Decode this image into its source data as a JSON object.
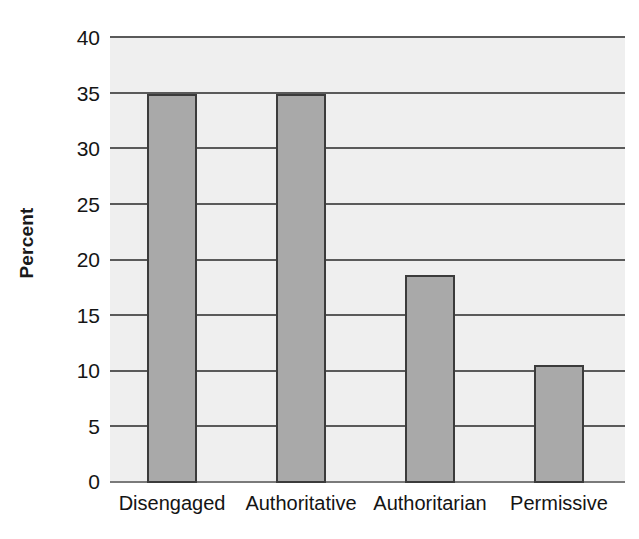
{
  "chart_data": {
    "type": "bar",
    "title": "",
    "xlabel": "",
    "ylabel": "Percent",
    "categories": [
      "Disengaged",
      "Authoritative",
      "Authoritarian",
      "Permissive"
    ],
    "values": [
      35,
      35,
      18.7,
      10.6
    ],
    "ylim": [
      0,
      40
    ],
    "ytick_labels": [
      "40",
      "35",
      "30",
      "25",
      "20",
      "15",
      "10",
      "5",
      "0"
    ],
    "ytick_values": [
      40,
      35,
      30,
      25,
      20,
      15,
      10,
      5,
      0
    ],
    "grid": true,
    "legend": "none",
    "series": [
      {
        "name": "Percent",
        "values": [
          35,
          35,
          18.7,
          10.6
        ],
        "color": "#a9a9a9",
        "edge_color": "#3b3b3b"
      }
    ],
    "plot_background": "#efefef",
    "figure_background": "#ffffff",
    "gridline_color": "#5a5a5a"
  }
}
